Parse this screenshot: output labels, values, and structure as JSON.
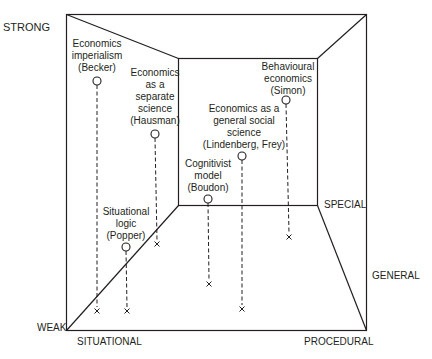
{
  "colors": {
    "line": "#231f20",
    "background": "#ffffff"
  },
  "axes": {
    "strong": "STRONG",
    "weak": "WEAK",
    "situational": "SITUATIONAL",
    "procedural": "PROCEDURAL",
    "special": "SPECIAL",
    "general": "GENERAL"
  },
  "points": [
    {
      "id": "becker",
      "lines": [
        "Economics",
        "imperialism",
        "(Becker)"
      ],
      "circle": [
        97,
        81
      ],
      "cross": [
        97,
        311
      ]
    },
    {
      "id": "hausman",
      "lines": [
        "Economics",
        "as a",
        "separate",
        "science",
        "(Hausman)"
      ],
      "circle": [
        155,
        134
      ],
      "cross": [
        157,
        244
      ]
    },
    {
      "id": "popper",
      "lines": [
        "Situational",
        "logic",
        "(Popper)"
      ],
      "circle": [
        126,
        247
      ],
      "cross": [
        127,
        311
      ]
    },
    {
      "id": "boudon",
      "lines": [
        "Cognitivist",
        "model",
        "(Boudon)"
      ],
      "circle": [
        208,
        199
      ],
      "cross": [
        209,
        284
      ]
    },
    {
      "id": "lindenberg-frey",
      "lines": [
        "Economics as a",
        "general social",
        "science",
        "(Lindenberg, Frey)"
      ],
      "circle": [
        242,
        156
      ],
      "cross": [
        242,
        309
      ]
    },
    {
      "id": "simon",
      "lines": [
        "Behavioural",
        "economics",
        "(Simon)"
      ],
      "circle": [
        286,
        100
      ],
      "cross": [
        289,
        237
      ]
    }
  ]
}
